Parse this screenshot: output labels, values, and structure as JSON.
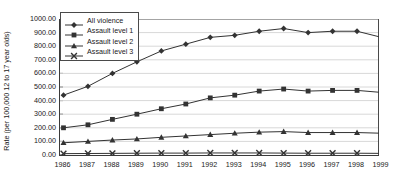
{
  "chart_data": {
    "type": "line",
    "title": "",
    "xlabel": "",
    "ylabel": "Rate (per 100,000 12 to 17 year olds)",
    "categories": [
      "1986",
      "1987",
      "1988",
      "1989",
      "1990",
      "1991",
      "1992",
      "1993",
      "1994",
      "1995",
      "1996",
      "1997",
      "1998",
      "1999"
    ],
    "x": [
      1986,
      1987,
      1988,
      1989,
      1990,
      1991,
      1992,
      1993,
      1994,
      1995,
      1996,
      1997,
      1998,
      1999
    ],
    "ylim": [
      0,
      1000
    ],
    "ytick_labels": [
      "0.00",
      "100.00",
      "200.00",
      "300.00",
      "400.00",
      "500.00",
      "600.00",
      "700.00",
      "800.00",
      "900.00",
      "1000.00"
    ],
    "ytick_values": [
      0,
      100,
      200,
      300,
      400,
      500,
      600,
      700,
      800,
      900,
      1000
    ],
    "grid": true,
    "legend_position": "top-left",
    "series": [
      {
        "name": "All violence",
        "marker": "diamond",
        "color": "#333333",
        "values": [
          440,
          505,
          600,
          685,
          765,
          815,
          865,
          880,
          910,
          930,
          900,
          910,
          910,
          865
        ]
      },
      {
        "name": "Assault level 1",
        "marker": "square",
        "color": "#333333",
        "values": [
          200,
          222,
          262,
          300,
          340,
          375,
          420,
          440,
          470,
          485,
          470,
          475,
          475,
          460
        ]
      },
      {
        "name": "Assault level 2",
        "marker": "triangle",
        "color": "#333333",
        "values": [
          90,
          100,
          110,
          118,
          130,
          140,
          150,
          160,
          168,
          172,
          165,
          165,
          165,
          160
        ]
      },
      {
        "name": "Assault level 3",
        "marker": "x",
        "color": "#333333",
        "values": [
          10,
          11,
          12,
          13,
          14,
          14,
          15,
          15,
          15,
          14,
          13,
          13,
          13,
          12
        ]
      }
    ]
  }
}
